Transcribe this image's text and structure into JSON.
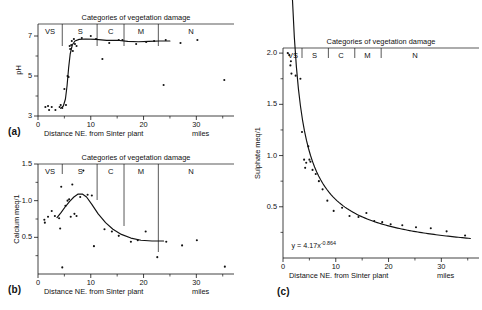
{
  "figure": {
    "panel_labels": {
      "a": "(a)",
      "b": "(b)",
      "c": "(c)"
    },
    "category_title": "Categories of vegetation damage",
    "xlabel": "Distance NE. from Sinter plant",
    "xunits": "miles",
    "categories": [
      "VS",
      "S",
      "C",
      "M",
      "N"
    ]
  },
  "chart_data": [
    {
      "id": "a",
      "type": "scatter",
      "title": "Categories of vegetation damage",
      "xlabel": "Distance NE. from Sinter plant",
      "ylabel": "pH",
      "xunits": "miles",
      "xlim": [
        0,
        36
      ],
      "ylim": [
        3,
        7.6
      ],
      "xticks": [
        0,
        10,
        20,
        30
      ],
      "xtick_labels": [
        "0",
        "10",
        "20",
        "30"
      ],
      "xminor": [
        5,
        15,
        25,
        35
      ],
      "yticks": [
        3,
        5,
        7
      ],
      "ytick_labels": [
        "3",
        "5",
        "7"
      ],
      "yminor": [
        4,
        6
      ],
      "grid": false,
      "legend": "none",
      "category_boundaries": [
        4.6,
        11.2,
        16.3,
        22.8
      ],
      "category_labels": [
        "VS",
        "S",
        "C",
        "M",
        "N"
      ],
      "category_label_x": [
        2.3,
        8.0,
        13.8,
        19.5,
        29.0
      ],
      "points": [
        [
          1.4,
          3.45
        ],
        [
          1.9,
          3.5
        ],
        [
          2.1,
          3.3
        ],
        [
          2.6,
          3.45
        ],
        [
          3.3,
          3.3
        ],
        [
          4.1,
          3.45
        ],
        [
          4.3,
          3.55
        ],
        [
          4.6,
          3.4
        ],
        [
          5.0,
          4.35
        ],
        [
          5.3,
          3.55
        ],
        [
          5.6,
          5.0
        ],
        [
          5.8,
          4.95
        ],
        [
          6.0,
          6.5
        ],
        [
          6.1,
          6.35
        ],
        [
          6.3,
          6.55
        ],
        [
          6.4,
          6.75
        ],
        [
          6.6,
          6.25
        ],
        [
          6.8,
          6.85
        ],
        [
          7.0,
          6.6
        ],
        [
          7.3,
          6.5
        ],
        [
          8.3,
          6.9
        ],
        [
          10.0,
          7.0
        ],
        [
          11.0,
          6.85
        ],
        [
          12.2,
          5.85
        ],
        [
          13.5,
          6.65
        ],
        [
          15.3,
          6.8
        ],
        [
          16.0,
          6.8
        ],
        [
          18.6,
          6.6
        ],
        [
          20.5,
          6.7
        ],
        [
          22.0,
          6.75
        ],
        [
          23.8,
          4.55
        ],
        [
          24.2,
          6.8
        ],
        [
          27.0,
          6.65
        ],
        [
          30.2,
          6.8
        ],
        [
          35.3,
          4.8
        ]
      ],
      "curve": [
        [
          4.3,
          3.38
        ],
        [
          4.8,
          3.5
        ],
        [
          5.2,
          3.85
        ],
        [
          5.5,
          4.5
        ],
        [
          5.8,
          5.4
        ],
        [
          6.1,
          6.1
        ],
        [
          6.5,
          6.55
        ],
        [
          7.0,
          6.75
        ],
        [
          7.8,
          6.83
        ],
        [
          9.0,
          6.85
        ],
        [
          11.0,
          6.83
        ],
        [
          13.0,
          6.78
        ],
        [
          15.0,
          6.79
        ],
        [
          17.0,
          6.73
        ],
        [
          19.0,
          6.71
        ],
        [
          21.0,
          6.73
        ],
        [
          23.0,
          6.75
        ],
        [
          25.0,
          6.75
        ]
      ]
    },
    {
      "id": "b",
      "type": "scatter",
      "title": "Categories of vegetation damage",
      "xlabel": "Distance NE. from Sinter plant",
      "ylabel": "Calcium meq/1",
      "xunits": "miles",
      "xlim": [
        0,
        36
      ],
      "ylim": [
        0.0,
        1.5
      ],
      "xticks": [
        0,
        10,
        20,
        30
      ],
      "xtick_labels": [
        "0",
        "10",
        "20",
        "30"
      ],
      "xminor": [
        5,
        15,
        25,
        35
      ],
      "yticks": [
        0.5,
        1.0,
        1.5
      ],
      "ytick_labels": [
        "0.5",
        "1.0",
        "1.5"
      ],
      "yminor": [
        0.25,
        0.75,
        1.25
      ],
      "grid": false,
      "legend": "none",
      "category_boundaries": [
        4.6,
        11.2,
        16.3,
        22.8
      ],
      "category_labels": [
        "VS",
        "S",
        "C",
        "M",
        "N"
      ],
      "category_label_x": [
        2.3,
        8.0,
        13.8,
        19.5,
        29.0
      ],
      "points": [
        [
          1.2,
          0.74
        ],
        [
          1.3,
          0.7
        ],
        [
          1.9,
          0.78
        ],
        [
          2.6,
          0.86
        ],
        [
          3.2,
          0.79
        ],
        [
          4.0,
          0.76
        ],
        [
          4.2,
          0.62
        ],
        [
          4.4,
          1.19
        ],
        [
          4.6,
          0.09
        ],
        [
          5.2,
          0.93
        ],
        [
          5.6,
          1.0
        ],
        [
          5.9,
          1.02
        ],
        [
          6.2,
          0.78
        ],
        [
          6.5,
          1.22
        ],
        [
          6.9,
          0.82
        ],
        [
          7.3,
          0.79
        ],
        [
          8.0,
          1.05
        ],
        [
          8.6,
          1.41
        ],
        [
          9.4,
          1.08
        ],
        [
          10.2,
          1.07
        ],
        [
          10.6,
          0.38
        ],
        [
          12.6,
          0.61
        ],
        [
          14.0,
          0.58
        ],
        [
          15.3,
          0.52
        ],
        [
          17.6,
          0.44
        ],
        [
          18.9,
          0.46
        ],
        [
          20.4,
          0.58
        ],
        [
          22.6,
          0.23
        ],
        [
          24.3,
          0.44
        ],
        [
          27.3,
          0.39
        ],
        [
          30.1,
          0.46
        ],
        [
          35.4,
          0.1
        ]
      ],
      "curve": [
        [
          3.6,
          0.77
        ],
        [
          4.4,
          0.84
        ],
        [
          5.2,
          0.92
        ],
        [
          6.0,
          0.99
        ],
        [
          6.8,
          1.05
        ],
        [
          7.6,
          1.09
        ],
        [
          8.4,
          1.09
        ],
        [
          9.2,
          1.05
        ],
        [
          10.2,
          0.95
        ],
        [
          11.4,
          0.82
        ],
        [
          12.8,
          0.7
        ],
        [
          14.2,
          0.61
        ],
        [
          15.8,
          0.54
        ],
        [
          17.6,
          0.49
        ],
        [
          19.5,
          0.46
        ],
        [
          21.6,
          0.45
        ],
        [
          23.8,
          0.45
        ]
      ]
    },
    {
      "id": "c",
      "type": "scatter",
      "title": "Categories of vegetation damage",
      "xlabel": "Distance NE. from Sinter plant",
      "ylabel": "Sulphate meq/1",
      "xunits": "miles",
      "xlim": [
        0,
        36
      ],
      "ylim": [
        0.0,
        2.05
      ],
      "xticks": [
        0,
        10,
        20,
        30
      ],
      "xtick_labels": [
        "0",
        "10",
        "20",
        "30"
      ],
      "xminor": [
        5,
        15,
        25,
        35
      ],
      "yticks": [
        0.5,
        1.0,
        1.5,
        2.0
      ],
      "ytick_labels": [
        "0.5",
        "1.0",
        "1.5",
        "2.0"
      ],
      "yminor": [
        0.25,
        0.75,
        1.25,
        1.75
      ],
      "grid": false,
      "legend": "none",
      "annotation": "y = 4.17x",
      "annotation_exponent": "-0.864",
      "category_boundaries": [
        3.6,
        8.6,
        13.6,
        18.6
      ],
      "category_labels": [
        "VS",
        "S",
        "C",
        "M",
        "N"
      ],
      "category_label_x": [
        1.9,
        6.0,
        11.0,
        16.0,
        25.0
      ],
      "points": [
        [
          0.9,
          2.0
        ],
        [
          1.2,
          1.98
        ],
        [
          1.4,
          1.88
        ],
        [
          1.5,
          1.92
        ],
        [
          1.6,
          1.8
        ],
        [
          2.4,
          1.78
        ],
        [
          3.3,
          1.75
        ],
        [
          3.6,
          1.23
        ],
        [
          4.0,
          0.96
        ],
        [
          4.2,
          0.88
        ],
        [
          4.4,
          0.93
        ],
        [
          4.8,
          1.09
        ],
        [
          5.0,
          0.96
        ],
        [
          5.2,
          0.94
        ],
        [
          5.6,
          0.86
        ],
        [
          6.2,
          0.82
        ],
        [
          6.8,
          0.75
        ],
        [
          7.5,
          0.67
        ],
        [
          8.4,
          0.56
        ],
        [
          9.6,
          0.46
        ],
        [
          11.2,
          0.49
        ],
        [
          12.6,
          0.41
        ],
        [
          14.3,
          0.4
        ],
        [
          15.8,
          0.44
        ],
        [
          17.3,
          0.36
        ],
        [
          18.8,
          0.35
        ],
        [
          20.4,
          0.33
        ],
        [
          22.6,
          0.32
        ],
        [
          25.2,
          0.3
        ],
        [
          28.0,
          0.29
        ],
        [
          31.0,
          0.26
        ],
        [
          34.5,
          0.22
        ]
      ],
      "curve_formula": {
        "a": 4.17,
        "b": -0.864,
        "xmin": 1.0,
        "xmax": 35.5
      }
    }
  ]
}
